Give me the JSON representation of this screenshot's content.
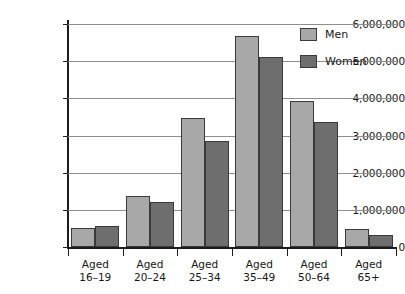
{
  "chart_data": {
    "type": "bar",
    "title": "",
    "subtitle": "",
    "xlabel": "",
    "ylabel": "",
    "ylim": [
      0,
      6000000
    ],
    "y_ticks": [
      0,
      1000000,
      2000000,
      3000000,
      4000000,
      5000000,
      6000000
    ],
    "y_tick_labels": [
      "0",
      "1,000,000",
      "2,000,000",
      "3,000,000",
      "4,000,000",
      "5,000,000",
      "6,000,000"
    ],
    "grid": true,
    "legend_position": "top-right",
    "categories": [
      "Aged 16–19",
      "Aged 20–24",
      "Aged 25–34",
      "Aged 35–49",
      "Aged 50–64",
      "Aged 65+"
    ],
    "category_lines": [
      {
        "line1": "Aged",
        "line2": "16–19"
      },
      {
        "line1": "Aged",
        "line2": "20–24"
      },
      {
        "line1": "Aged",
        "line2": "25–34"
      },
      {
        "line1": "Aged",
        "line2": "35–49"
      },
      {
        "line1": "Aged",
        "line2": "50–64"
      },
      {
        "line1": "Aged",
        "line2": "65+"
      }
    ],
    "series": [
      {
        "name": "Men",
        "color": "#a8a8a8",
        "values": [
          520000,
          1380000,
          3480000,
          5680000,
          3930000,
          490000
        ]
      },
      {
        "name": "Women",
        "color": "#6e6e6e",
        "values": [
          560000,
          1220000,
          2850000,
          5110000,
          3360000,
          320000
        ]
      }
    ]
  },
  "legend": {
    "items": [
      {
        "label": "Men",
        "color": "#a8a8a8"
      },
      {
        "label": "Women",
        "color": "#6e6e6e"
      }
    ]
  },
  "colors": {
    "men": "#a8a8a8",
    "women": "#6e6e6e",
    "gridline": "#8e8e8e",
    "axis": "#1c1c1c",
    "text": "#161616",
    "background": "#ffffff"
  }
}
